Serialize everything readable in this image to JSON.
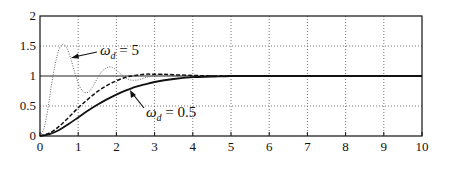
{
  "chart_data": {
    "type": "line",
    "title": "",
    "xlabel": "",
    "ylabel": "",
    "xlim": [
      0,
      10
    ],
    "ylim": [
      0,
      2
    ],
    "grid": true,
    "x_ticks": [
      "0",
      "1",
      "2",
      "3",
      "4",
      "5",
      "6",
      "7",
      "8",
      "9",
      "10"
    ],
    "y_ticks": [
      "0",
      "0.5",
      "1",
      "1.5",
      "2"
    ],
    "series": [
      {
        "name": "omega_d = 5",
        "style": "dotted",
        "x": [
          0,
          0.1,
          0.2,
          0.3,
          0.4,
          0.5,
          0.6,
          0.7,
          0.8,
          0.9,
          1.0,
          1.1,
          1.2,
          1.3,
          1.4,
          1.5,
          1.6,
          1.7,
          1.8,
          1.9,
          2.0,
          2.1,
          2.2,
          2.3,
          2.4,
          2.5,
          2.6,
          2.8,
          3.0,
          3.2,
          3.5,
          4.0,
          5.0,
          10.0
        ],
        "values": [
          0,
          0.12,
          0.42,
          0.85,
          1.2,
          1.45,
          1.53,
          1.47,
          1.3,
          1.08,
          0.88,
          0.76,
          0.72,
          0.75,
          0.84,
          0.96,
          1.06,
          1.12,
          1.15,
          1.14,
          1.1,
          1.04,
          0.99,
          0.95,
          0.93,
          0.93,
          0.94,
          0.98,
          1.01,
          1.02,
          1.01,
          1.0,
          1.0,
          1.0
        ]
      },
      {
        "name": "dashed",
        "style": "dashed",
        "x": [
          0,
          0.25,
          0.5,
          0.75,
          1.0,
          1.25,
          1.5,
          1.75,
          2.0,
          2.25,
          2.5,
          2.75,
          3.0,
          3.25,
          3.5,
          4.0,
          4.5,
          5.0,
          10.0
        ],
        "values": [
          0,
          0.05,
          0.16,
          0.31,
          0.47,
          0.61,
          0.74,
          0.84,
          0.92,
          0.98,
          1.01,
          1.03,
          1.03,
          1.03,
          1.02,
          1.01,
          1.0,
          1.0,
          1.0
        ]
      },
      {
        "name": "omega_d = 0.5",
        "style": "solid",
        "x": [
          0,
          0.25,
          0.5,
          0.75,
          1.0,
          1.25,
          1.5,
          1.75,
          2.0,
          2.25,
          2.5,
          2.75,
          3.0,
          3.5,
          4.0,
          4.5,
          5.0,
          5.5,
          10.0
        ],
        "values": [
          0,
          0.03,
          0.1,
          0.2,
          0.31,
          0.42,
          0.52,
          0.61,
          0.69,
          0.76,
          0.82,
          0.86,
          0.9,
          0.95,
          0.98,
          0.99,
          1.0,
          1.0,
          1.0
        ]
      }
    ],
    "annotations": [
      {
        "text_symbol": "ω",
        "subscript": "d",
        "rest": " = 5",
        "target": "omega_d = 5"
      },
      {
        "text_symbol": "ω",
        "subscript": "d",
        "rest": " = 0.5",
        "target": "omega_d = 0.5"
      }
    ]
  }
}
